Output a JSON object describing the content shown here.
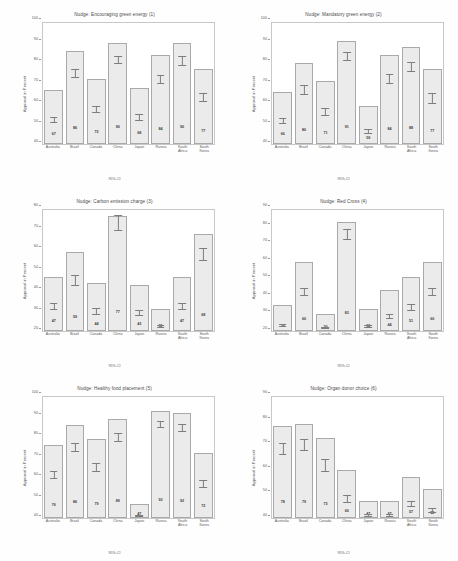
{
  "figure": {
    "countries": [
      "Australia",
      "Brazil",
      "Canada",
      "China",
      "Japan",
      "Russia",
      "South Africa",
      "South Korea"
    ],
    "y_axis_label": "Approval in Percent",
    "x_axis_note": "95%-CI",
    "bar_fill": "#ebebeb",
    "bar_edge": "#a9a9a9"
  },
  "chart_data": [
    {
      "type": "bar",
      "title": "Nudge: Encouraging green energy (1)",
      "xlabel": "95%-CI",
      "ylabel": "Approval in Percent",
      "categories": [
        "Australia",
        "Brazil",
        "Canada",
        "China",
        "Japan",
        "Russia",
        "South Africa",
        "South Korea"
      ],
      "values": [
        67,
        86,
        72,
        90,
        68,
        84,
        90,
        77
      ],
      "ci_low": [
        64,
        83,
        69,
        88,
        65,
        81,
        87,
        74
      ],
      "ci_high": [
        70,
        89,
        76,
        93,
        72,
        87,
        93,
        81
      ],
      "ylim": [
        40,
        100
      ],
      "yticks": [
        40,
        50,
        60,
        70,
        80,
        90,
        100
      ],
      "ytick_labels": [
        "40",
        "50",
        "60",
        "70",
        "80",
        "90",
        "100"
      ],
      "grid": false,
      "legend": "none"
    },
    {
      "type": "bar",
      "title": "Nudge: Mandatory green energy (2)",
      "xlabel": "95%-CI",
      "ylabel": "Approval in Percent",
      "categories": [
        "Australia",
        "Brazil",
        "Canada",
        "China",
        "Japan",
        "Russia",
        "South Africa",
        "South Korea"
      ],
      "values": [
        66,
        80,
        71,
        91,
        59,
        84,
        88,
        77
      ],
      "ci_low": [
        63,
        77,
        67,
        89,
        55,
        81,
        85,
        73
      ],
      "ci_high": [
        70,
        84,
        75,
        94,
        63,
        88,
        91,
        81
      ],
      "ylim": [
        40,
        100
      ],
      "yticks": [
        40,
        50,
        60,
        70,
        80,
        90,
        100
      ],
      "ytick_labels": [
        "40",
        "50",
        "60",
        "70",
        "80",
        "90",
        "100"
      ],
      "grid": false,
      "legend": "none"
    },
    {
      "type": "bar",
      "title": "Nudge: Carbon emission charge (3)",
      "xlabel": "95%-CI",
      "ylabel": "Approval in Percent",
      "categories": [
        "Australia",
        "Brazil",
        "Canada",
        "China",
        "Japan",
        "Russia",
        "South Africa",
        "South Korea"
      ],
      "values": [
        47,
        59,
        44,
        77,
        43,
        31,
        47,
        68
      ],
      "ci_low": [
        43,
        55,
        40,
        73,
        39,
        27,
        43,
        64
      ],
      "ci_high": [
        51,
        63,
        48,
        81,
        47,
        35,
        51,
        72
      ],
      "ylim": [
        20,
        80
      ],
      "yticks": [
        20,
        30,
        40,
        50,
        60,
        70,
        80
      ],
      "ytick_labels": [
        "20",
        "30",
        "40",
        "50",
        "60",
        "70",
        "80"
      ],
      "grid": false,
      "legend": "none"
    },
    {
      "type": "bar",
      "title": "Nudge: Red Cross (4)",
      "xlabel": "95%-CI",
      "ylabel": "Approval in Percent",
      "categories": [
        "Australia",
        "Brazil",
        "Canada",
        "China",
        "Japan",
        "Russia",
        "South Africa",
        "South Korea"
      ],
      "values": [
        35,
        60,
        30,
        83,
        33,
        44,
        51,
        60
      ],
      "ci_low": [
        31,
        56,
        26,
        79,
        29,
        40,
        47,
        56
      ],
      "ci_high": [
        39,
        64,
        34,
        86,
        37,
        48,
        55,
        64
      ],
      "ylim": [
        20,
        90
      ],
      "yticks": [
        20,
        30,
        40,
        50,
        60,
        70,
        80,
        90
      ],
      "ytick_labels": [
        "20",
        "30",
        "40",
        "50",
        "60",
        "70",
        "80",
        "90"
      ],
      "grid": false,
      "legend": "none"
    },
    {
      "type": "bar",
      "title": "Nudge: Healthy food placement (5)",
      "xlabel": "95%-CI",
      "ylabel": "Approval in Percent",
      "categories": [
        "Australia",
        "Brazil",
        "Canada",
        "China",
        "Japan",
        "Russia",
        "South Africa",
        "South Korea"
      ],
      "values": [
        76,
        86,
        79,
        89,
        47,
        93,
        92,
        72
      ],
      "ci_low": [
        73,
        83,
        76,
        87,
        43,
        91,
        90,
        68
      ],
      "ci_high": [
        79,
        89,
        82,
        92,
        51,
        95,
        94,
        76
      ],
      "ylim": [
        40,
        100
      ],
      "yticks": [
        40,
        50,
        60,
        70,
        80,
        90,
        100
      ],
      "ytick_labels": [
        "40",
        "50",
        "60",
        "70",
        "80",
        "90",
        "100"
      ],
      "grid": false,
      "legend": "none"
    },
    {
      "type": "bar",
      "title": "Nudge: Organ donor choice (6)",
      "xlabel": "95%-CI",
      "ylabel": "Approval in Percent",
      "categories": [
        "Australia",
        "Brazil",
        "Canada",
        "China",
        "Japan",
        "Russia",
        "South Africa",
        "South Korea"
      ],
      "values": [
        78,
        79,
        73,
        60,
        47,
        47,
        57,
        52
      ],
      "ci_low": [
        75,
        76,
        69,
        56,
        43,
        43,
        53,
        48
      ],
      "ci_high": [
        81,
        82,
        77,
        64,
        51,
        51,
        61,
        56
      ],
      "ylim": [
        40,
        90
      ],
      "yticks": [
        40,
        50,
        60,
        70,
        80,
        90
      ],
      "ytick_labels": [
        "40",
        "50",
        "60",
        "70",
        "80",
        "90"
      ],
      "grid": false,
      "legend": "none"
    }
  ]
}
